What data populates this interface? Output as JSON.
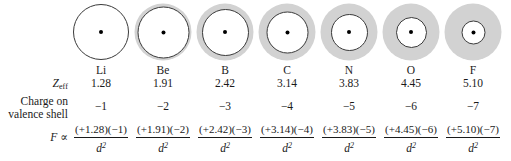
{
  "figure": {
    "type": "diagram",
    "row_labels": {
      "zeff": "Z",
      "zeff_subscript": "eff",
      "charge_line1": "Charge on",
      "charge_line2": "valence shell",
      "force_symbol": "F",
      "force_proportional": "∝"
    },
    "shell_color": "#d2d2d2",
    "columns": [
      {
        "symbol": "Li",
        "zeff": "1.28",
        "charge": "−1",
        "numerator": "(+1.28)(−1)",
        "denominator": "d",
        "denominator_exponent": "2",
        "outer_diameter": 56,
        "core_diameter": 56
      },
      {
        "symbol": "Be",
        "zeff": "1.91",
        "charge": "−2",
        "numerator": "(+1.91)(−2)",
        "denominator": "d",
        "denominator_exponent": "2",
        "outer_diameter": 57,
        "core_diameter": 52
      },
      {
        "symbol": "B",
        "zeff": "2.42",
        "charge": "−3",
        "numerator": "(+2.42)(−3)",
        "denominator": "d",
        "denominator_exponent": "2",
        "outer_diameter": 57,
        "core_diameter": 47
      },
      {
        "symbol": "C",
        "zeff": "3.14",
        "charge": "−4",
        "numerator": "(+3.14)(−4)",
        "denominator": "d",
        "denominator_exponent": "2",
        "outer_diameter": 57,
        "core_diameter": 42
      },
      {
        "symbol": "N",
        "zeff": "3.83",
        "charge": "−5",
        "numerator": "(+3.83)(−5)",
        "denominator": "d",
        "denominator_exponent": "2",
        "outer_diameter": 57,
        "core_diameter": 37
      },
      {
        "symbol": "O",
        "zeff": "4.45",
        "charge": "−6",
        "numerator": "(+4.45)(−6)",
        "denominator": "d",
        "denominator_exponent": "2",
        "outer_diameter": 57,
        "core_diameter": 31
      },
      {
        "symbol": "F",
        "zeff": "5.10",
        "charge": "−7",
        "numerator": "(+5.10)(−7)",
        "denominator": "d",
        "denominator_exponent": "2",
        "outer_diameter": 57,
        "core_diameter": 24
      }
    ]
  }
}
